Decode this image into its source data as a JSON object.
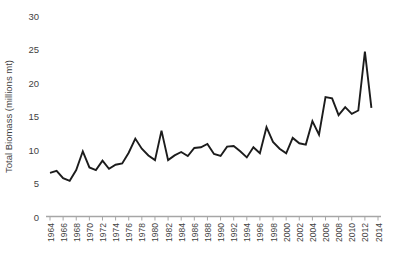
{
  "chart_data": {
    "type": "line",
    "title": "",
    "xlabel": "",
    "ylabel": "Total Biomass (millions mt)",
    "x": [
      1964,
      1965,
      1966,
      1967,
      1968,
      1969,
      1970,
      1971,
      1972,
      1973,
      1974,
      1975,
      1976,
      1977,
      1978,
      1979,
      1980,
      1981,
      1982,
      1983,
      1984,
      1985,
      1986,
      1987,
      1988,
      1989,
      1990,
      1991,
      1992,
      1993,
      1994,
      1995,
      1996,
      1997,
      1998,
      1999,
      2000,
      2001,
      2002,
      2003,
      2004,
      2005,
      2006,
      2007,
      2008,
      2009,
      2010,
      2011,
      2012,
      2013
    ],
    "values": [
      6.6,
      6.9,
      5.8,
      5.4,
      7.0,
      9.8,
      7.4,
      7.0,
      8.4,
      7.2,
      7.8,
      8.0,
      9.6,
      11.7,
      10.2,
      9.2,
      8.5,
      12.9,
      8.5,
      9.2,
      9.7,
      9.1,
      10.3,
      10.4,
      10.9,
      9.4,
      9.1,
      10.5,
      10.6,
      9.8,
      8.9,
      10.4,
      9.5,
      13.4,
      11.2,
      10.2,
      9.5,
      11.8,
      11.0,
      10.8,
      14.3,
      12.3,
      17.9,
      17.7,
      15.2,
      16.4,
      15.4,
      15.9,
      24.7,
      16.3
    ],
    "ylim": [
      0,
      30
    ],
    "yticks": [
      0,
      5,
      10,
      15,
      20,
      25,
      30
    ],
    "xticks": [
      1964,
      1966,
      1968,
      1970,
      1972,
      1974,
      1976,
      1978,
      1980,
      1982,
      1984,
      1986,
      1988,
      1990,
      1992,
      1994,
      1996,
      1998,
      2000,
      2002,
      2004,
      2006,
      2008,
      2010,
      2012,
      2014
    ],
    "grid": false,
    "legend": "none"
  },
  "colors": {
    "background": "#ffffff",
    "line": "#1c1c1c",
    "axis": "#a6a6a6",
    "text": "#3f3f3f"
  }
}
